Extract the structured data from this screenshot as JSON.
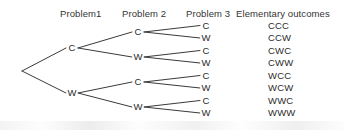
{
  "figure": {
    "type": "probability-tree-diagram",
    "background_color": "#ffffff",
    "line_color": "#3a3a3a",
    "text_color": "#2b2b2b"
  },
  "headers": [
    {
      "label": "Problem1",
      "x": 60,
      "y": 8
    },
    {
      "label": "Problem 2",
      "x": 122,
      "y": 8
    },
    {
      "label": "Problem 3",
      "x": 186,
      "y": 8
    },
    {
      "label": "Elementary outcomes",
      "x": 236,
      "y": 8
    }
  ],
  "root": {
    "x": 22,
    "y": 71
  },
  "stage1_nodes": [
    {
      "label": "C",
      "x": 72,
      "y": 48
    },
    {
      "label": "W",
      "x": 72,
      "y": 93
    }
  ],
  "stage2_nodes": [
    {
      "label": "C",
      "x": 138,
      "y": 32
    },
    {
      "label": "W",
      "x": 138,
      "y": 57
    },
    {
      "label": "C",
      "x": 138,
      "y": 82
    },
    {
      "label": "W",
      "x": 138,
      "y": 107
    }
  ],
  "stage3_nodes": [
    {
      "label": "C",
      "x": 206,
      "y": 25.5
    },
    {
      "label": "W",
      "x": 206,
      "y": 38
    },
    {
      "label": "C",
      "x": 206,
      "y": 50.5
    },
    {
      "label": "W",
      "x": 206,
      "y": 63
    },
    {
      "label": "C",
      "x": 206,
      "y": 75.5
    },
    {
      "label": "W",
      "x": 206,
      "y": 88
    },
    {
      "label": "C",
      "x": 206,
      "y": 100.5
    },
    {
      "label": "W",
      "x": 206,
      "y": 113
    }
  ],
  "outcomes": [
    {
      "label": "CCC",
      "x": 268,
      "y": 25.5
    },
    {
      "label": "CCW",
      "x": 268,
      "y": 38
    },
    {
      "label": "CWC",
      "x": 268,
      "y": 50.5
    },
    {
      "label": "CWW",
      "x": 268,
      "y": 63
    },
    {
      "label": "WCC",
      "x": 268,
      "y": 75.5
    },
    {
      "label": "WCW",
      "x": 268,
      "y": 88
    },
    {
      "label": "WWC",
      "x": 268,
      "y": 100.5
    },
    {
      "label": "WWW",
      "x": 268,
      "y": 113
    }
  ],
  "edges": [
    {
      "x1": 22,
      "y1": 71,
      "x2": 66,
      "y2": 48
    },
    {
      "x1": 22,
      "y1": 71,
      "x2": 66,
      "y2": 93
    },
    {
      "x1": 78,
      "y1": 48,
      "x2": 132,
      "y2": 32
    },
    {
      "x1": 78,
      "y1": 48,
      "x2": 132,
      "y2": 57
    },
    {
      "x1": 78,
      "y1": 93,
      "x2": 132,
      "y2": 82
    },
    {
      "x1": 78,
      "y1": 93,
      "x2": 132,
      "y2": 107
    },
    {
      "x1": 144,
      "y1": 32,
      "x2": 200,
      "y2": 25.5
    },
    {
      "x1": 144,
      "y1": 32,
      "x2": 200,
      "y2": 38
    },
    {
      "x1": 144,
      "y1": 57,
      "x2": 200,
      "y2": 50.5
    },
    {
      "x1": 144,
      "y1": 57,
      "x2": 200,
      "y2": 63
    },
    {
      "x1": 144,
      "y1": 82,
      "x2": 200,
      "y2": 75.5
    },
    {
      "x1": 144,
      "y1": 82,
      "x2": 200,
      "y2": 88
    },
    {
      "x1": 144,
      "y1": 107,
      "x2": 200,
      "y2": 100.5
    },
    {
      "x1": 144,
      "y1": 107,
      "x2": 200,
      "y2": 113
    }
  ]
}
